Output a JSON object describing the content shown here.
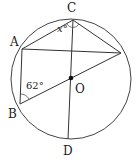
{
  "diagram": {
    "type": "circle-geometry",
    "circle": {
      "center": "O",
      "cx": 71,
      "cy": 79,
      "r": 60
    },
    "points": {
      "C": {
        "x": 73,
        "y": 20,
        "label": "C"
      },
      "A": {
        "x": 22,
        "y": 49,
        "label": "A"
      },
      "B": {
        "x": 20,
        "y": 104,
        "label": "B"
      },
      "E": {
        "x": 121,
        "y": 53,
        "label": ""
      },
      "O": {
        "x": 71,
        "y": 78,
        "label": "O"
      },
      "D": {
        "x": 68,
        "y": 139,
        "label": "D"
      }
    },
    "segments": [
      [
        "C",
        "A"
      ],
      [
        "C",
        "E"
      ],
      [
        "A",
        "E"
      ],
      [
        "C",
        "D"
      ],
      [
        "B",
        "E"
      ],
      [
        "A",
        "B"
      ]
    ],
    "angles": {
      "x": {
        "vertex": "C",
        "label": "x°"
      },
      "abc": {
        "vertex": "B",
        "label": "62°"
      }
    }
  },
  "colors": {
    "stroke": "#333333",
    "text": "#222222"
  }
}
